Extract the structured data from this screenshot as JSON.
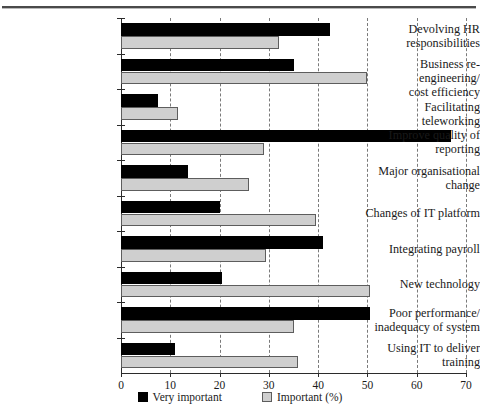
{
  "chart_data": {
    "type": "bar",
    "orientation": "horizontal",
    "title": "",
    "xlabel": "",
    "ylabel": "",
    "xlim": [
      0,
      70
    ],
    "xticks": [
      0,
      10,
      20,
      30,
      40,
      50,
      60,
      70
    ],
    "grid": true,
    "legend_position": "bottom",
    "categories": [
      "Devolving HR responsibilities",
      "Business re-engineering/ cost efficiency",
      "Facilitating teleworking",
      "Improve quality of reporting",
      "Major organisational change",
      "Changes of IT platform",
      "Integrating payroll",
      "New technology",
      "Poor performance/ inadequacy of system",
      "Using IT to deliver training"
    ],
    "category_lines": [
      [
        "Devolving HR",
        "responsibilities"
      ],
      [
        "Business re-engineering/",
        "cost efficiency"
      ],
      [
        "Facilitating teleworking"
      ],
      [
        "Improve quality of",
        "reporting"
      ],
      [
        "Major organisational",
        "change"
      ],
      [
        "Changes of IT platform"
      ],
      [
        "Integrating payroll"
      ],
      [
        "New technology"
      ],
      [
        "Poor performance/",
        "inadequacy of system"
      ],
      [
        "Using IT to deliver",
        "training"
      ]
    ],
    "series": [
      {
        "name": "Very important",
        "color": "#000000",
        "values": [
          42.5,
          35,
          7.5,
          67,
          13.5,
          20,
          41,
          20.5,
          50.5,
          11
        ]
      },
      {
        "name": "Important (%)",
        "color": "#cfcfcf",
        "values": [
          32,
          50,
          11.5,
          29,
          26,
          39.5,
          29.5,
          50.5,
          35,
          36
        ]
      }
    ]
  },
  "legend": {
    "items": [
      {
        "label": "Very important",
        "swatch": "black-square-icon"
      },
      {
        "label": "Important (%)",
        "swatch": "grey-square-icon"
      }
    ]
  },
  "axis": {
    "x_tick_labels": [
      "0",
      "10",
      "20",
      "30",
      "40",
      "50",
      "60",
      "70"
    ]
  }
}
